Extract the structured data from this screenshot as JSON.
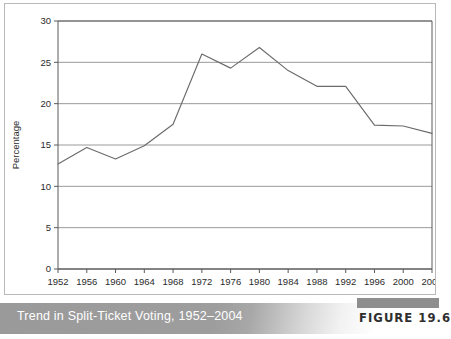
{
  "figure": {
    "caption": "Trend in Split-Ticket Voting, 1952–2004",
    "number_label": "FIGURE 19.6"
  },
  "chart_data": {
    "type": "line",
    "title": "Trend in Split-Ticket Voting, 1952–2004",
    "xlabel": "Year",
    "ylabel": "Percentage",
    "categories": [
      1952,
      1956,
      1960,
      1964,
      1968,
      1972,
      1976,
      1980,
      1984,
      1988,
      1992,
      1996,
      2000,
      2004
    ],
    "values": [
      12.7,
      14.7,
      13.3,
      14.9,
      17.5,
      26.0,
      24.3,
      26.8,
      24.0,
      22.1,
      22.1,
      17.4,
      17.3,
      16.4
    ],
    "xtick_labels": [
      "1952",
      "1956",
      "1960",
      "1964",
      "1968",
      "1972",
      "1976",
      "1980",
      "1984",
      "1988",
      "1992",
      "1996",
      "2000",
      "2004"
    ],
    "ytick_labels": [
      "0",
      "5",
      "10",
      "15",
      "20",
      "25",
      "30"
    ],
    "yticks": [
      0,
      5,
      10,
      15,
      20,
      25,
      30
    ],
    "ylim": [
      0,
      30
    ],
    "xlim": [
      1952,
      2004
    ],
    "grid": "horizontal",
    "legend": "none",
    "line_color": "#6b6b6b",
    "grid_color": "#9a9a9a",
    "axis_color": "#5a5a5a"
  }
}
